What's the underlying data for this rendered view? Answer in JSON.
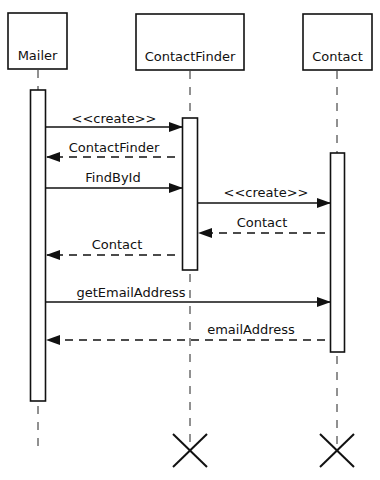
{
  "diagram": {
    "type": "sequence",
    "participants": [
      {
        "id": "mailer",
        "name": "Mailer"
      },
      {
        "id": "finder",
        "name": "ContactFinder"
      },
      {
        "id": "contact",
        "name": "Contact"
      }
    ],
    "messages": [
      {
        "from": "Mailer",
        "to": "ContactFinder",
        "label": "<<create>>",
        "kind": "call"
      },
      {
        "from": "ContactFinder",
        "to": "Mailer",
        "label": "ContactFinder",
        "kind": "return"
      },
      {
        "from": "Mailer",
        "to": "ContactFinder",
        "label": "FindById",
        "kind": "call"
      },
      {
        "from": "ContactFinder",
        "to": "Contact",
        "label": "<<create>>",
        "kind": "call"
      },
      {
        "from": "Contact",
        "to": "ContactFinder",
        "label": "Contact",
        "kind": "return"
      },
      {
        "from": "ContactFinder",
        "to": "Mailer",
        "label": "Contact",
        "kind": "return"
      },
      {
        "from": "Mailer",
        "to": "Contact",
        "label": "getEmailAddress",
        "kind": "call"
      },
      {
        "from": "Contact",
        "to": "Mailer",
        "label": "emailAddress",
        "kind": "return"
      }
    ],
    "destroyed": [
      "ContactFinder",
      "Contact"
    ]
  }
}
